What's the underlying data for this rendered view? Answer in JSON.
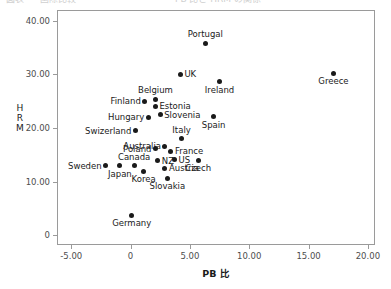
{
  "chart_data": {
    "type": "scatter",
    "title": "",
    "xlabel": "PB 比",
    "ylabel": "HRM",
    "xlim": [
      -6.2,
      20.6
    ],
    "ylim": [
      -1.8,
      42.0
    ],
    "xticks": [
      "-5.00",
      "0",
      "5.00",
      "10.00",
      "15.00",
      "20.00"
    ],
    "xtick_values": [
      -5,
      0,
      5,
      10,
      15,
      20
    ],
    "yticks": [
      "0",
      "10.00",
      "20.00",
      "30.00",
      "40.00"
    ],
    "ytick_values": [
      0,
      10,
      20,
      30,
      40
    ],
    "grid": false,
    "legend": "none",
    "marker_color": "#1a1a1a",
    "points": [
      {
        "label": "Portugal",
        "x": 6.3,
        "y": 35.8,
        "label_pos": "above"
      },
      {
        "label": "Greece",
        "x": 17.1,
        "y": 30.2,
        "label_pos": "below"
      },
      {
        "label": "UK",
        "x": 4.2,
        "y": 30.0,
        "label_pos": "right"
      },
      {
        "label": "Ireland",
        "x": 7.5,
        "y": 28.6,
        "label_pos": "below"
      },
      {
        "label": "Belgium",
        "x": 2.1,
        "y": 25.4,
        "label_pos": "above"
      },
      {
        "label": "Finland",
        "x": 1.2,
        "y": 25.0,
        "label_pos": "left"
      },
      {
        "label": "Estonia",
        "x": 2.1,
        "y": 24.1,
        "label_pos": "right"
      },
      {
        "label": "Slovenia",
        "x": 2.5,
        "y": 22.5,
        "label_pos": "right"
      },
      {
        "label": "Hungary",
        "x": 1.5,
        "y": 22.0,
        "label_pos": "left"
      },
      {
        "label": "Spain",
        "x": 7.0,
        "y": 22.1,
        "label_pos": "below"
      },
      {
        "label": "Swizerland",
        "x": 0.4,
        "y": 19.5,
        "label_pos": "left"
      },
      {
        "label": "Italy",
        "x": 4.3,
        "y": 18.0,
        "label_pos": "above"
      },
      {
        "label": "Australia",
        "x": 2.9,
        "y": 16.6,
        "label_pos": "left"
      },
      {
        "label": "France",
        "x": 3.4,
        "y": 15.7,
        "label_pos": "right"
      },
      {
        "label": "Poland",
        "x": 2.1,
        "y": 16.1,
        "label_pos": "left"
      },
      {
        "label": "US",
        "x": 3.7,
        "y": 14.1,
        "label_pos": "right"
      },
      {
        "label": "NZ",
        "x": 2.3,
        "y": 13.9,
        "label_pos": "right"
      },
      {
        "label": "Czech",
        "x": 5.7,
        "y": 14.0,
        "label_pos": "below"
      },
      {
        "label": "Austria",
        "x": 2.9,
        "y": 12.5,
        "label_pos": "right"
      },
      {
        "label": "Sweden",
        "x": -2.1,
        "y": 13.0,
        "label_pos": "left"
      },
      {
        "label": "Japan",
        "x": -0.9,
        "y": 13.0,
        "label_pos": "below"
      },
      {
        "label": "Canada",
        "x": 0.3,
        "y": 13.0,
        "label_pos": "above"
      },
      {
        "label": "Korea",
        "x": 1.1,
        "y": 11.9,
        "label_pos": "below"
      },
      {
        "label": "Slovakia",
        "x": 3.1,
        "y": 10.6,
        "label_pos": "below"
      },
      {
        "label": "Germany",
        "x": 0.1,
        "y": 3.7,
        "label_pos": "below"
      }
    ]
  },
  "top_clipped_text": {
    "segments": [
      "図表",
      "国際比較",
      "PB 比と HRM の関係"
    ]
  }
}
